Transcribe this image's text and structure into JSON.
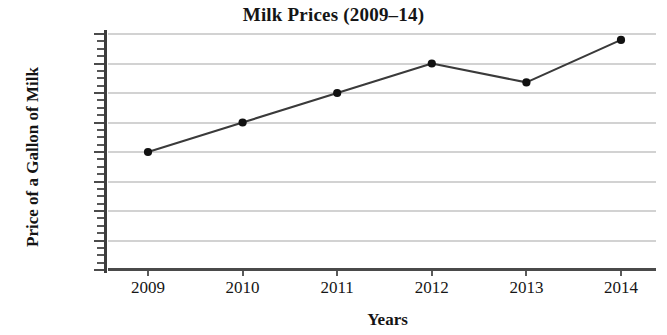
{
  "chart_data": {
    "type": "line",
    "title": "Milk Prices (2009–14)",
    "xlabel": "Years",
    "ylabel": "Price of a Gallon of Milk",
    "categories": [
      "2009",
      "2010",
      "2011",
      "2012",
      "2013",
      "2014"
    ],
    "values": [
      2.0,
      2.5,
      3.0,
      3.5,
      3.18,
      3.9
    ],
    "series": [
      {
        "name": "Price of a Gallon of Milk",
        "values": [
          2.0,
          2.5,
          3.0,
          3.5,
          3.18,
          3.9
        ]
      }
    ],
    "ylim": [
      0,
      4
    ],
    "xlim": [
      "2009",
      "2014"
    ],
    "y_tick_labels": [
      "$4",
      "$3.50",
      "$3",
      "$2.50",
      "$2",
      "$1.50",
      "$1",
      "0"
    ],
    "y_tick_values": [
      4,
      3.5,
      3,
      2.5,
      2,
      1.5,
      1,
      0
    ],
    "y_major_step": 0.5,
    "y_minor_step": 0.125,
    "x_tick_labels": [
      "2009",
      "2010",
      "2011",
      "2012",
      "2013",
      "2014"
    ],
    "grid": true,
    "grid_axis": "y",
    "legend": false,
    "legend_position": "none",
    "marker": "filled-circle",
    "line_color": "#3a3a3a",
    "marker_color": "#111111",
    "grid_color": "#d2d2d2",
    "axis_color": "#4a4a4a",
    "background_color": "#ffffff",
    "annotations": []
  }
}
